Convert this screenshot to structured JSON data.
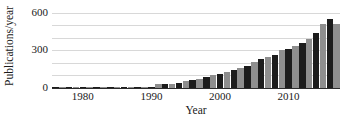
{
  "chart_data": {
    "type": "bar",
    "title": "",
    "xlabel": "Year",
    "ylabel": "Publications/year",
    "xlim": [
      1975.5,
      2017.5
    ],
    "ylim": [
      0,
      620
    ],
    "grid": true,
    "legend": false,
    "y_tick_labels": [
      "0",
      "300",
      "600"
    ],
    "y_tick_values": [
      0,
      300,
      600
    ],
    "y_gridline_values": [
      0,
      100,
      200,
      300,
      400,
      500,
      600
    ],
    "x_tick_labels": [
      "1980",
      "1990",
      "2000",
      "2010"
    ],
    "x_tick_values": [
      1980,
      1990,
      2000,
      2010
    ],
    "bar_colors": [
      "#1c1c1c",
      "#8e8e8e"
    ],
    "categories": [
      "1976",
      "1977",
      "1978",
      "1979",
      "1980",
      "1981",
      "1982",
      "1983",
      "1984",
      "1985",
      "1986",
      "1987",
      "1988",
      "1989",
      "1990",
      "1991",
      "1992",
      "1993",
      "1994",
      "1995",
      "1996",
      "1997",
      "1998",
      "1999",
      "2000",
      "2001",
      "2002",
      "2003",
      "2004",
      "2005",
      "2006",
      "2007",
      "2008",
      "2009",
      "2010",
      "2011",
      "2012",
      "2013",
      "2014",
      "2015",
      "2016",
      "2017"
    ],
    "values": [
      2,
      2,
      3,
      3,
      4,
      4,
      5,
      5,
      6,
      5,
      5,
      6,
      7,
      8,
      10,
      28,
      34,
      32,
      40,
      55,
      62,
      75,
      88,
      100,
      108,
      130,
      145,
      160,
      172,
      205,
      228,
      248,
      262,
      300,
      312,
      330,
      355,
      392,
      438,
      510,
      552,
      505
    ]
  }
}
